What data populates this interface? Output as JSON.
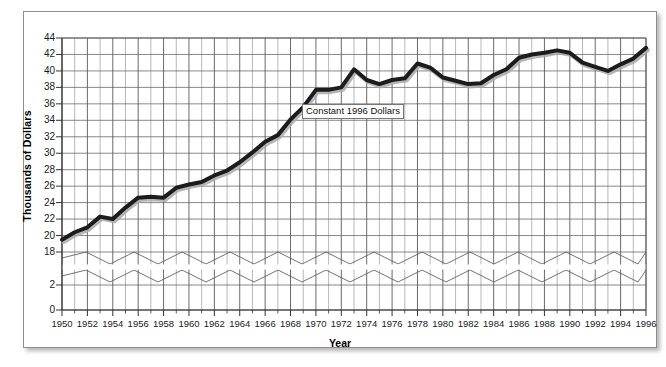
{
  "chart_data": {
    "type": "line",
    "title": "",
    "xlabel": "Year",
    "ylabel": "Thousands of Dollars",
    "annotation": "Constant 1996 Dollars",
    "grid": true,
    "legend_position": "none",
    "axis_break": {
      "present": true,
      "between": [
        2,
        18
      ],
      "style": "double-zigzag"
    },
    "xlim": [
      1950,
      1996
    ],
    "ylim": [
      0,
      44
    ],
    "ytick_labels": [
      "44",
      "42",
      "40",
      "38",
      "36",
      "34",
      "32",
      "30",
      "28",
      "26",
      "24",
      "22",
      "20",
      "18",
      "2",
      "0"
    ],
    "ytick_values": [
      44,
      42,
      40,
      38,
      36,
      34,
      32,
      30,
      28,
      26,
      24,
      22,
      20,
      18,
      2,
      0
    ],
    "xtick_labels": [
      "1950",
      "1952",
      "1954",
      "1956",
      "1958",
      "1960",
      "1962",
      "1964",
      "1966",
      "1968",
      "1970",
      "1972",
      "1974",
      "1976",
      "1978",
      "1980",
      "1982",
      "1984",
      "1986",
      "1988",
      "1990",
      "1992",
      "1994",
      "1996"
    ],
    "xtick_values": [
      1950,
      1952,
      1954,
      1956,
      1958,
      1960,
      1962,
      1964,
      1966,
      1968,
      1970,
      1972,
      1974,
      1976,
      1978,
      1980,
      1982,
      1984,
      1986,
      1988,
      1990,
      1992,
      1994,
      1996
    ],
    "x": [
      1950,
      1951,
      1952,
      1953,
      1954,
      1955,
      1956,
      1957,
      1958,
      1959,
      1960,
      1961,
      1962,
      1963,
      1964,
      1965,
      1966,
      1967,
      1968,
      1969,
      1970,
      1971,
      1972,
      1973,
      1974,
      1975,
      1976,
      1977,
      1978,
      1979,
      1980,
      1981,
      1982,
      1983,
      1984,
      1985,
      1986,
      1987,
      1988,
      1989,
      1990,
      1991,
      1992,
      1993,
      1994,
      1995,
      1996
    ],
    "series": [
      {
        "name": "Constant 1996 Dollars",
        "values": [
          19.5,
          20.4,
          21.0,
          22.3,
          22.0,
          23.4,
          24.6,
          24.7,
          24.6,
          25.8,
          26.2,
          26.5,
          27.3,
          27.9,
          28.9,
          30.1,
          31.4,
          32.2,
          34.1,
          35.6,
          37.7,
          37.7,
          38.0,
          40.2,
          38.9,
          38.4,
          38.9,
          39.1,
          40.9,
          40.4,
          39.2,
          38.8,
          38.4,
          38.5,
          39.5,
          40.2,
          41.6,
          42.0,
          42.2,
          42.5,
          42.2,
          41.0,
          40.5,
          40.0,
          40.8,
          41.5,
          42.8
        ]
      }
    ],
    "yaxis_note": "Values shown are in thousands of dollars; the y-axis is broken between 2 and 18."
  },
  "axes": {
    "y_title": "Thousands of Dollars",
    "x_title": "Year"
  },
  "annotation": {
    "text": "Constant 1996 Dollars"
  },
  "colors": {
    "line": "#1c1c1c",
    "line_shadow": "#a9a9a9",
    "grid": "#5a5a5a",
    "frame": "#8e8e8e",
    "text": "#111111",
    "background": "#ffffff"
  }
}
